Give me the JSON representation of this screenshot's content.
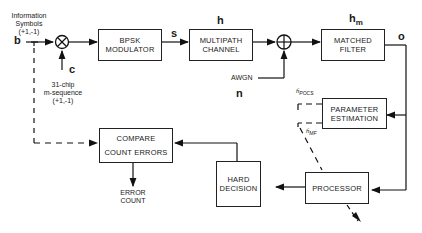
{
  "diagram": {
    "type": "block-diagram",
    "blocks": {
      "bpsk_modulator": [
        "BPSK",
        "MODULATOR"
      ],
      "multipath_channel": [
        "MULTIPATH",
        "CHANNEL"
      ],
      "matched_filter": [
        "MATCHED",
        "FILTER"
      ],
      "parameter_estimation": [
        "PARAMETER",
        "ESTIMATION"
      ],
      "processor": [
        "PROCESSOR"
      ],
      "hard_decision": [
        "HARD",
        "DECISION"
      ],
      "compare": [
        "COMPARE",
        "COUNT ERRORS"
      ]
    },
    "labels": {
      "info_symbols": [
        "Information",
        "Symbols",
        "(+1,-1)"
      ],
      "m_sequence": [
        "31-chip",
        "m-sequence",
        "(+1,-1)"
      ],
      "awgn": "AWGN",
      "error_count": [
        "ERROR",
        "COUNT"
      ]
    },
    "signals": {
      "b": "b",
      "c": "c",
      "s": "s",
      "h": "h",
      "n": "n",
      "hm": "h",
      "hm_sub": "m",
      "o": "o",
      "h_pocs": "ĥ",
      "h_pocs_sub": "POCS",
      "h_mf": "ĥ",
      "h_mf_sub": "MF"
    },
    "operators": {
      "multiplier": "⊗",
      "adder": "⊕"
    }
  }
}
